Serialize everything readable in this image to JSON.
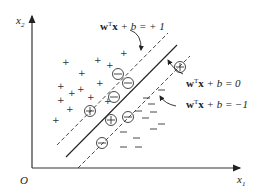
{
  "diagram": {
    "axes": {
      "x_label": "x",
      "x_sub": "1",
      "y_label": "x",
      "y_sub": "2",
      "origin_label": "O"
    },
    "equations": {
      "positive_margin": {
        "w": "w",
        "sup": "T",
        "x": "x",
        "rest": " + b = + 1"
      },
      "hyperplane": {
        "w": "w",
        "sup": "T",
        "x": "x",
        "rest": " + b = 0"
      },
      "negative_margin": {
        "w": "w",
        "sup": "T",
        "x": "x",
        "rest": " + b = −1"
      }
    },
    "positive_symbol": "+",
    "negative_symbol": "−",
    "positive_points_count": 14,
    "negative_points_count": 12,
    "support_vectors": {
      "circled_minus": 5,
      "circled_plus": 3
    }
  }
}
